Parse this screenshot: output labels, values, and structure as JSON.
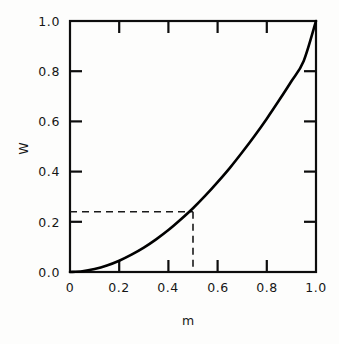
{
  "chart_data": {
    "type": "line",
    "title": "",
    "xlabel": "m",
    "ylabel": "W",
    "xlim": [
      0,
      1.0
    ],
    "ylim": [
      0,
      1.0
    ],
    "grid": false,
    "legend": null,
    "x_tick_labels": [
      "0",
      "0.2",
      "0.4",
      "0.6",
      "0.8",
      "1.0"
    ],
    "x_tick_values": [
      0,
      0.2,
      0.4,
      0.6,
      0.8,
      1.0
    ],
    "y_tick_labels": [
      "0.0",
      "0.2",
      "0.4",
      "0.6",
      "0.8",
      "1.0"
    ],
    "y_tick_values": [
      0,
      0.2,
      0.4,
      0.6,
      0.8,
      1.0
    ],
    "series": [
      {
        "name": "W(m)",
        "style": "solid",
        "color": "#000000",
        "x": [
          0.0,
          0.05,
          0.1,
          0.15,
          0.2,
          0.25,
          0.3,
          0.35,
          0.4,
          0.45,
          0.5,
          0.55,
          0.6,
          0.65,
          0.7,
          0.75,
          0.8,
          0.85,
          0.9,
          0.95,
          1.0
        ],
        "y": [
          0.0,
          0.003,
          0.012,
          0.026,
          0.045,
          0.069,
          0.097,
          0.13,
          0.167,
          0.209,
          0.254,
          0.304,
          0.358,
          0.415,
          0.477,
          0.542,
          0.611,
          0.684,
          0.76,
          0.841,
          1.0
        ]
      }
    ],
    "annotations": [
      {
        "name": "horizontal-guide",
        "style": "dashed",
        "color": "#1a1a1a",
        "from": [
          0.0,
          0.24
        ],
        "to": [
          0.5,
          0.24
        ]
      },
      {
        "name": "vertical-guide",
        "style": "dashed",
        "color": "#1a1a1a",
        "from": [
          0.5,
          0.24
        ],
        "to": [
          0.5,
          0.0
        ]
      }
    ],
    "marked_point": {
      "m": 0.5,
      "W": 0.24
    }
  },
  "axes": {
    "y_title": "W",
    "x_title": "m",
    "y_labels": {
      "t0": "0.0",
      "t1": "0.2",
      "t2": "0.4",
      "t3": "0.6",
      "t4": "0.8",
      "t5": "1.0"
    },
    "x_labels": {
      "t0": "0",
      "t1": "0.2",
      "t2": "0.4",
      "t3": "0.6",
      "t4": "0.8",
      "t5": "1.0"
    }
  },
  "colors": {
    "background": "#fdfdfc",
    "ink": "#161616",
    "curve": "#000000",
    "guide": "#1a1a1a"
  }
}
